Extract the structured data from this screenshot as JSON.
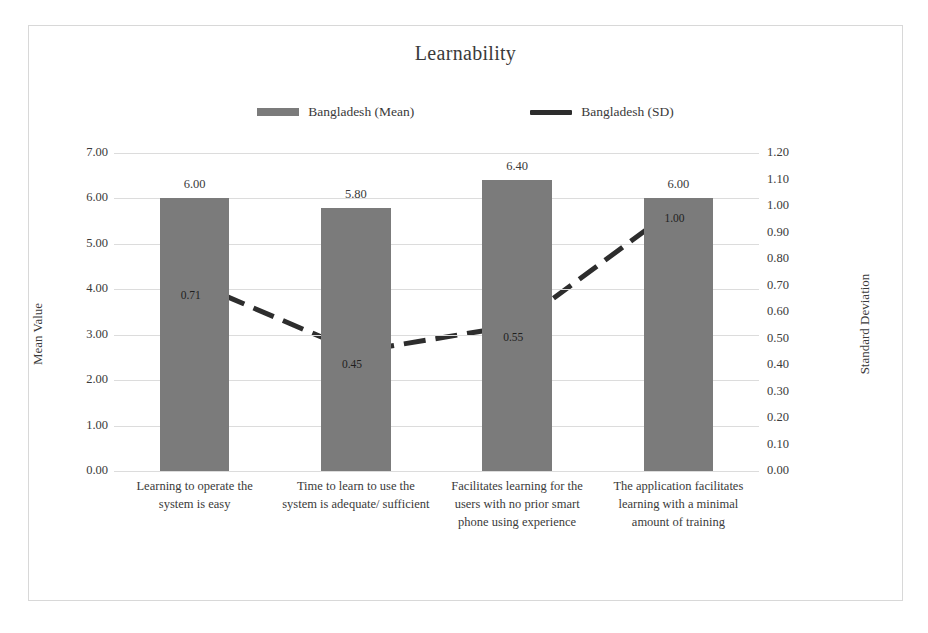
{
  "chart_data": {
    "type": "bar",
    "title": "Learnability",
    "xlabel": "",
    "ylabel": "Mean Value",
    "y2label": "Standard Deviation",
    "ylim": [
      0,
      7
    ],
    "y2lim": [
      0,
      1.2
    ],
    "grid": true,
    "legend_position": "top-center",
    "categories": [
      "Learning to operate the system is easy",
      "Time to learn to use the system is adequate/ sufficient",
      "Facilitates learning for the users with no prior smart phone using experience",
      "The application facilitates learning with a minimal amount of training"
    ],
    "series": [
      {
        "name": "Bangladesh (Mean)",
        "type": "bar",
        "axis": "left",
        "color": "#7b7b7b",
        "values": [
          6.0,
          5.8,
          6.4,
          6.0
        ],
        "labels": [
          "6.00",
          "5.80",
          "6.40",
          "6.00"
        ]
      },
      {
        "name": "Bangladesh (SD)",
        "type": "line",
        "axis": "right",
        "color": "#2d2d2d",
        "dashed": true,
        "values": [
          0.71,
          0.45,
          0.55,
          1.0
        ],
        "labels": [
          "0.71",
          "0.45",
          "0.55",
          "1.00"
        ]
      }
    ],
    "y_ticks": [
      "7.00",
      "6.00",
      "5.00",
      "4.00",
      "3.00",
      "2.00",
      "1.00",
      "0.00"
    ],
    "y_tick_values": [
      7,
      6,
      5,
      4,
      3,
      2,
      1,
      0
    ],
    "y2_ticks": [
      "1.20",
      "1.10",
      "1.00",
      "0.90",
      "0.80",
      "0.70",
      "0.60",
      "0.50",
      "0.40",
      "0.30",
      "0.20",
      "0.10",
      "0.00"
    ],
    "y2_tick_values": [
      1.2,
      1.1,
      1.0,
      0.9,
      0.8,
      0.7,
      0.6,
      0.5,
      0.4,
      0.3,
      0.2,
      0.1,
      0
    ]
  },
  "colors": {
    "bar": "#7b7b7b",
    "line": "#2d2d2d",
    "grid": "#dcdcdc",
    "frame": "#d8d8d8",
    "text": "#3a3a3a",
    "background": "#ffffff"
  },
  "legend": {
    "items": [
      {
        "label": "Bangladesh (Mean)",
        "marker": "bar-swatch-icon"
      },
      {
        "label": "Bangladesh (SD)",
        "marker": "line-swatch-icon"
      }
    ]
  }
}
